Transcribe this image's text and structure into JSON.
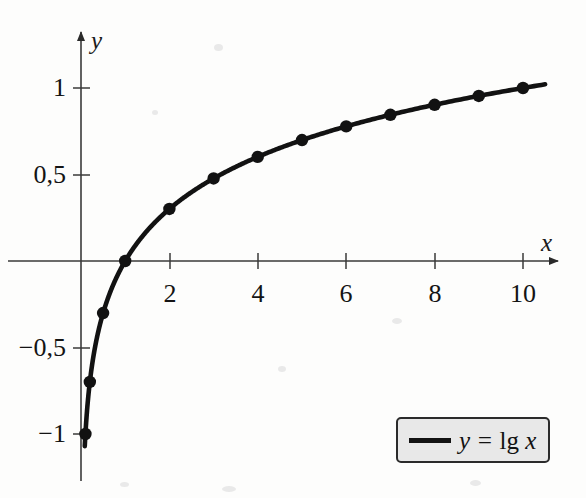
{
  "chart_data": {
    "type": "line",
    "title": "",
    "subtitle": "",
    "xlabel": "x",
    "ylabel": "y",
    "xlim": [
      -0.35,
      11.2
    ],
    "ylim": [
      -1.12,
      1.22
    ],
    "grid": false,
    "legend_position": "bottom-right",
    "decimal_separator": ",",
    "x_ticks": [
      2,
      4,
      6,
      8,
      10
    ],
    "x_tick_labels": [
      "2",
      "4",
      "6",
      "8",
      "10"
    ],
    "y_ticks": [
      1,
      0.5,
      -0.5,
      -1
    ],
    "y_tick_labels": [
      "1",
      "0,5",
      "−0,5",
      "−1"
    ],
    "series": [
      {
        "name": "y = lg x",
        "legend_label_html": "y = lg x",
        "color": "#121212",
        "marker": "filled-circle",
        "x": [
          0.1,
          0.2,
          0.5,
          1,
          2,
          3,
          4,
          5,
          6,
          7,
          8,
          9,
          10
        ],
        "values": [
          -1.0,
          -0.699,
          -0.301,
          0.0,
          0.301,
          0.477,
          0.602,
          0.699,
          0.778,
          0.845,
          0.903,
          0.954,
          1.0
        ]
      }
    ],
    "annotations": []
  },
  "axes": {
    "x_axis_name": "x",
    "y_axis_name": "y",
    "x_arrow": true,
    "y_arrow": true
  },
  "legend": {
    "entry_label_italic": "y = lg ",
    "entry_variable": "x",
    "equals_part": "y = ",
    "function_part": "lg",
    "argument_part": "x",
    "fill_color": "#e8e8e8",
    "border_color": "#2b2b2b",
    "line_color": "#121212"
  }
}
